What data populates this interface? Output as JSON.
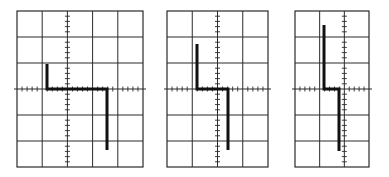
{
  "figure": {
    "background": "#ffffff",
    "grid_color": "#2a2a2a",
    "trace_color": "#111111"
  },
  "panels": [
    {
      "id": "panel-1",
      "x": 17,
      "y": 11,
      "width": 126,
      "height": 156,
      "cols": 5,
      "rows": 6,
      "axis_col": 2,
      "axis_row": 3,
      "trace": [
        [
          47,
          64
        ],
        [
          47,
          89
        ],
        [
          107,
          89
        ],
        [
          107,
          150
        ]
      ]
    },
    {
      "id": "panel-2",
      "x": 167,
      "y": 11,
      "width": 101,
      "height": 156,
      "cols": 4,
      "rows": 6,
      "axis_col": 2,
      "axis_row": 3,
      "trace": [
        [
          197,
          44
        ],
        [
          197,
          89
        ],
        [
          228,
          89
        ],
        [
          228,
          150
        ]
      ]
    },
    {
      "id": "panel-3",
      "x": 295,
      "y": 11,
      "width": 74,
      "height": 156,
      "cols": 3,
      "rows": 6,
      "axis_col": 2,
      "axis_row": 3,
      "trace": [
        [
          324,
          25
        ],
        [
          324,
          89
        ],
        [
          339,
          89
        ],
        [
          339,
          151
        ]
      ]
    }
  ]
}
